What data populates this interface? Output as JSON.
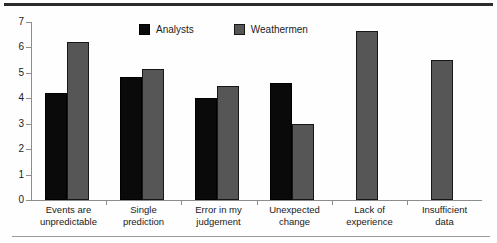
{
  "chart_data": {
    "type": "bar",
    "title": "",
    "subtitle": "",
    "xlabel": "",
    "ylabel": "",
    "ylim": [
      0,
      7
    ],
    "yticks": [
      "0",
      "1",
      "2",
      "3",
      "4",
      "5",
      "6",
      "7"
    ],
    "grid": false,
    "legend_position": "top-center",
    "categories": [
      "Events are\nunpredictable",
      "Single\nprediction",
      "Error in my\njudgement",
      "Unexpected\nchange",
      "Lack of\nexperience",
      "Insufficient\ndata"
    ],
    "category_lines": [
      [
        "Events are",
        "unpredictable"
      ],
      [
        "Single",
        "prediction"
      ],
      [
        "Error in my",
        "judgement"
      ],
      [
        "Unexpected",
        "change"
      ],
      [
        "Lack of",
        "experience"
      ],
      [
        "Insufficient",
        "data"
      ]
    ],
    "series": [
      {
        "name": "Analysts",
        "color": "#0a0a0a",
        "values": [
          4.2,
          4.85,
          4.0,
          4.6,
          null,
          null
        ]
      },
      {
        "name": "Weathermen",
        "color": "#565656",
        "values": [
          6.2,
          5.15,
          4.5,
          3.0,
          6.65,
          5.5
        ]
      }
    ],
    "annotations": []
  },
  "legend": {
    "items": [
      {
        "label": "Analysts",
        "swatch": "black-square-swatch"
      },
      {
        "label": "Weathermen",
        "swatch": "gray-square-swatch"
      }
    ]
  }
}
